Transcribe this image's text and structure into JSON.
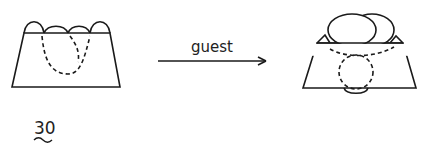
{
  "diagram": {
    "arrow_label": "guest",
    "figure_number": "30",
    "colors": {
      "stroke": "#1a1a1a",
      "background": "#ffffff"
    }
  }
}
